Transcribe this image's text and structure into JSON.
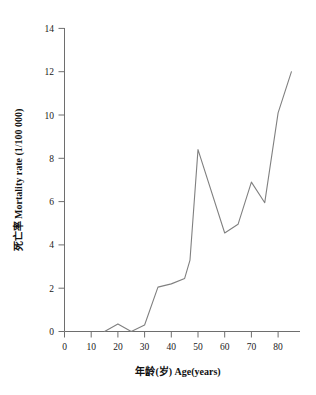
{
  "chart_data": {
    "type": "line",
    "title": "",
    "subtitle": "",
    "xlabel": "年龄(岁) Age(years)",
    "ylabel": "死亡率 Mortality rate (1/100 000)",
    "xlim": [
      0,
      88
    ],
    "ylim": [
      0,
      14
    ],
    "xticks": [
      0,
      10,
      20,
      30,
      40,
      50,
      60,
      70,
      80
    ],
    "yticks": [
      0,
      2,
      4,
      6,
      8,
      10,
      12,
      14
    ],
    "xtick_labels": [
      "0",
      "10",
      "20",
      "30",
      "40",
      "50",
      "60",
      "70",
      "80"
    ],
    "ytick_labels": [
      "0",
      "2",
      "4",
      "6",
      "8",
      "10",
      "12",
      "14"
    ],
    "xminor_ticks": [
      5,
      15,
      25,
      35,
      45,
      55,
      65,
      75,
      85
    ],
    "grid": false,
    "legend": null,
    "legend_position": "none",
    "line_color": "#808080",
    "series": [
      {
        "name": "Mortality rate",
        "x": [
          15,
          20,
          25,
          30,
          35,
          40,
          45,
          47,
          50,
          60,
          65,
          70,
          75,
          80,
          85
        ],
        "values": [
          0.0,
          0.35,
          0.0,
          0.3,
          2.05,
          2.2,
          2.45,
          3.3,
          8.4,
          4.55,
          4.95,
          6.9,
          5.95,
          10.1,
          12.0
        ]
      }
    ],
    "annotations": []
  },
  "axes": {
    "y_title": "死亡率 Mortality rate (1/100 000)",
    "x_title": "年龄(岁) Age(years)"
  }
}
